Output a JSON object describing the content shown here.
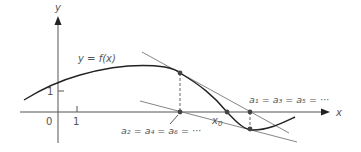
{
  "figure": {
    "axes": {
      "x_label": "x",
      "y_label": "y",
      "origin_label": "0",
      "x_tick_label": "1",
      "y_tick_label": "1"
    },
    "curve_label": "y = f(x)",
    "root_label": "x",
    "root_subscript": "0",
    "odd_iterates_label": "a₁ = a₃ = a₅ = ···",
    "even_iterates_label": "a₂ = a₄ = a₆ = ···",
    "colors": {
      "curve": "#222222",
      "axis": "#555555",
      "tangent": "#777777",
      "points": "#444444",
      "text": "#555555"
    }
  }
}
